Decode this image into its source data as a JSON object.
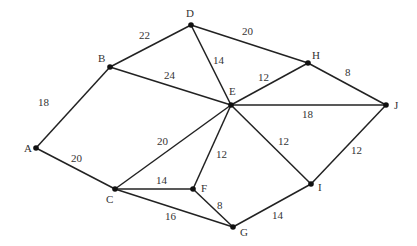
{
  "graph": {
    "type": "weighted-undirected-graph",
    "nodes": [
      {
        "id": "A",
        "x": 36,
        "y": 148,
        "lx": 24,
        "ly": 152
      },
      {
        "id": "B",
        "x": 110,
        "y": 67,
        "lx": 98,
        "ly": 62
      },
      {
        "id": "C",
        "x": 115,
        "y": 189,
        "lx": 106,
        "ly": 203
      },
      {
        "id": "D",
        "x": 191,
        "y": 25,
        "lx": 186,
        "ly": 17
      },
      {
        "id": "E",
        "x": 231,
        "y": 105,
        "lx": 229,
        "ly": 95
      },
      {
        "id": "F",
        "x": 193,
        "y": 189,
        "lx": 201,
        "ly": 192
      },
      {
        "id": "G",
        "x": 233,
        "y": 227,
        "lx": 240,
        "ly": 236
      },
      {
        "id": "H",
        "x": 308,
        "y": 63,
        "lx": 312,
        "ly": 59
      },
      {
        "id": "I",
        "x": 311,
        "y": 184,
        "lx": 318,
        "ly": 191
      },
      {
        "id": "J",
        "x": 386,
        "y": 105,
        "lx": 394,
        "ly": 109
      }
    ],
    "edges": [
      {
        "from": "A",
        "to": "B",
        "weight": "18",
        "lx": 38,
        "ly": 106
      },
      {
        "from": "A",
        "to": "C",
        "weight": "20",
        "lx": 71,
        "ly": 162
      },
      {
        "from": "B",
        "to": "D",
        "weight": "22",
        "lx": 139,
        "ly": 39
      },
      {
        "from": "B",
        "to": "E",
        "weight": "24",
        "lx": 164,
        "ly": 79
      },
      {
        "from": "D",
        "to": "E",
        "weight": "14",
        "lx": 213,
        "ly": 64
      },
      {
        "from": "D",
        "to": "H",
        "weight": "20",
        "lx": 242,
        "ly": 35
      },
      {
        "from": "E",
        "to": "H",
        "weight": "12",
        "lx": 258,
        "ly": 81
      },
      {
        "from": "H",
        "to": "J",
        "weight": "8",
        "lx": 345,
        "ly": 76
      },
      {
        "from": "E",
        "to": "J",
        "weight": "18",
        "lx": 302,
        "ly": 118
      },
      {
        "from": "C",
        "to": "E",
        "weight": "20",
        "lx": 157,
        "ly": 145
      },
      {
        "from": "C",
        "to": "F",
        "weight": "14",
        "lx": 156,
        "ly": 184
      },
      {
        "from": "C",
        "to": "G",
        "weight": "16",
        "lx": 165,
        "ly": 220
      },
      {
        "from": "F",
        "to": "E",
        "weight": "12",
        "lx": 216,
        "ly": 158
      },
      {
        "from": "F",
        "to": "G",
        "weight": "8",
        "lx": 217,
        "ly": 209
      },
      {
        "from": "E",
        "to": "I",
        "weight": "12",
        "lx": 278,
        "ly": 145
      },
      {
        "from": "I",
        "to": "J",
        "weight": "12",
        "lx": 351,
        "ly": 154
      },
      {
        "from": "G",
        "to": "I",
        "weight": "14",
        "lx": 272,
        "ly": 219
      }
    ]
  }
}
